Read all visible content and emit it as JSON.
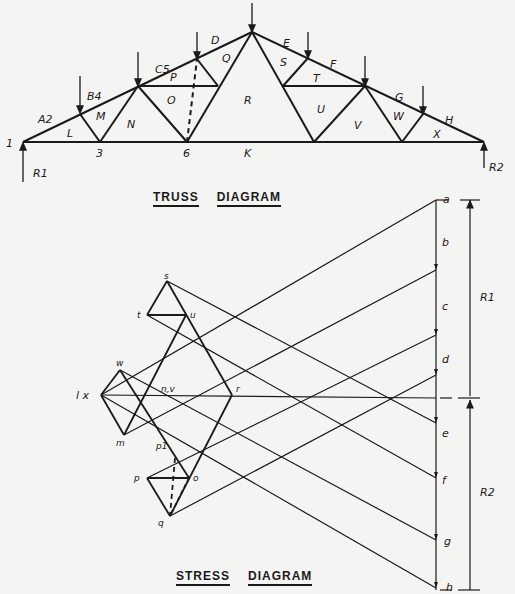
{
  "truss_diagram": {
    "title_words": [
      "TRUSS",
      "DIAGRAM"
    ],
    "region_labels": {
      "A2": "A2",
      "B4": "B4",
      "C5": "C5",
      "D": "D",
      "E": "E",
      "F": "F",
      "G": "G",
      "H": "H",
      "L": "L",
      "M": "M",
      "N": "N",
      "O": "O",
      "P": "P",
      "Q": "Q",
      "R": "R",
      "S": "S",
      "T": "T",
      "U": "U",
      "V": "V",
      "W": "W",
      "X": "X",
      "K": "K"
    },
    "node_labels": {
      "n1": "1",
      "n3": "3",
      "n6": "6"
    },
    "reactions": {
      "left": "R1",
      "right": "R2"
    }
  },
  "stress_diagram": {
    "title_words": [
      "STRESS",
      "DIAGRAM"
    ],
    "load_line_labels": [
      "a",
      "b",
      "c",
      "d",
      "e",
      "f",
      "g",
      "h"
    ],
    "point_labels": {
      "s": "s",
      "t": "t",
      "u": "u",
      "w": "w",
      "x": "l x",
      "m": "m",
      "nv": "n,v",
      "r": "r",
      "p1": "p1",
      "p": "p",
      "o": "o",
      "q": "q"
    },
    "reactions": {
      "upper": "R1",
      "lower": "R2"
    }
  }
}
